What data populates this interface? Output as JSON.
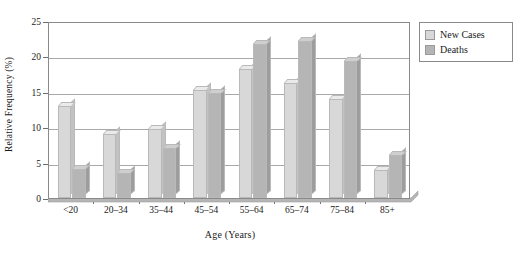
{
  "chart_data": {
    "type": "bar",
    "title": "",
    "xlabel": "Age (Years)",
    "ylabel": "Relative Frequency (%)",
    "categories": [
      "<20",
      "20–34",
      "35–44",
      "45–54",
      "55–64",
      "65–74",
      "75–84",
      "85+"
    ],
    "series": [
      {
        "name": "New Cases",
        "color": "#d8d8d8",
        "values": [
          13.0,
          9.1,
          9.8,
          15.3,
          18.2,
          16.2,
          14.0,
          4.0
        ]
      },
      {
        "name": "Deaths",
        "color": "#b5b5b5",
        "values": [
          4.1,
          3.6,
          7.1,
          14.9,
          21.8,
          22.2,
          19.4,
          6.1
        ]
      }
    ],
    "ylim": [
      0,
      25
    ],
    "yticks": [
      0,
      5,
      10,
      15,
      20,
      25
    ],
    "ytick_labels": [
      "0",
      "5",
      "10",
      "15",
      "20",
      "25"
    ],
    "grid": true,
    "legend_position": "top-right"
  },
  "legend": {
    "items": [
      {
        "label": "New Cases"
      },
      {
        "label": "Deaths"
      }
    ]
  }
}
